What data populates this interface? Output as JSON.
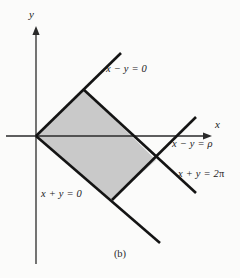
{
  "figure": {
    "caption": "(b)",
    "background_color": "#fbfbfa",
    "shaded_region_color": "#c9c9c9",
    "line_color": "#141414",
    "axis_color": "#2a2a2a"
  },
  "axes": {
    "x_label": "x",
    "y_label": "y",
    "origin": {
      "x": 36,
      "y": 136
    },
    "x_axis": {
      "x1": 6,
      "y1": 136,
      "x2": 212,
      "y2": 136
    },
    "y_axis": {
      "x1": 36,
      "y1": 264,
      "x2": 36,
      "y2": 26
    }
  },
  "region": {
    "name": "shaded-parallelogram",
    "vertices": [
      {
        "x": 36,
        "y": 136
      },
      {
        "x": 83,
        "y": 89
      },
      {
        "x": 156,
        "y": 160
      },
      {
        "x": 112,
        "y": 200
      }
    ]
  },
  "boundary_lines": [
    {
      "id": "line-x-minus-y-equals-0",
      "label": "x − y = 0",
      "x1": 36,
      "y1": 136,
      "x2": 121,
      "y2": 53
    },
    {
      "id": "line-x-minus-y-equals-rho",
      "label": "x − y = ρ",
      "x1": 112,
      "y1": 200,
      "x2": 196,
      "y2": 117
    },
    {
      "id": "line-x-plus-y-equals-0",
      "label": "x + y = 0",
      "x1": 36,
      "y1": 136,
      "x2": 160,
      "y2": 243
    },
    {
      "id": "line-x-plus-y-equals-2pi",
      "label": "x + y = 2π",
      "x1": 83,
      "y1": 89,
      "x2": 196,
      "y2": 193
    }
  ],
  "labels": {
    "x_minus_y_0": "x − y = 0",
    "x_minus_y_rho": "x − y = ρ",
    "x_plus_y_0": "x + y = 0",
    "x_plus_y_2pi_prefix": "x + y = 2",
    "x_plus_y_2pi_symbol": "π"
  }
}
